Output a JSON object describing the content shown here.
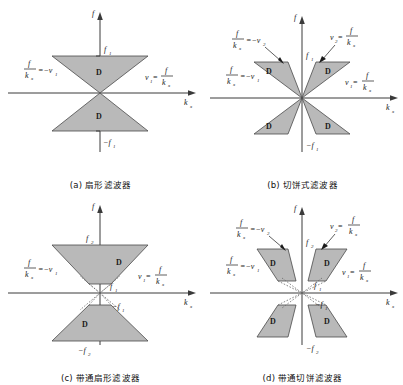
{
  "figure": {
    "title": "",
    "axis_labels": {
      "vertical": "f",
      "horizontal": "k",
      "horizontal_sub": "x"
    },
    "region_label": "D",
    "numerator": "f",
    "denominator": "k",
    "denominator_sub": "x"
  },
  "panels": [
    {
      "id": "a",
      "caption": "(a) 扇形滤波器",
      "type": "fan-filter",
      "cut_labels": {
        "top": "f",
        "top_sub": "1",
        "bottom": "−f",
        "bottom_sub": "1"
      },
      "slope_left": {
        "text": "=−v",
        "sub": "1",
        "side": "left"
      },
      "slope_right": {
        "text": "v",
        "sub": "1",
        "eq": "=",
        "side": "right"
      },
      "regions": [
        "D",
        "D"
      ]
    },
    {
      "id": "b",
      "caption": "(b) 切饼式滤波器",
      "type": "pie-slice-filter",
      "cut_labels": {
        "top": "f",
        "top_sub": "1",
        "bottom": "−f",
        "bottom_sub": "1"
      },
      "slope_outer_left": {
        "text": "=−v",
        "sub": "2"
      },
      "slope_outer_right": {
        "text": "v",
        "sub": "2",
        "eq": "="
      },
      "slope_inner_left": {
        "text": "=−v",
        "sub": "1"
      },
      "slope_inner_right": {
        "text": "v",
        "sub": "1",
        "eq": "="
      },
      "regions": [
        "D",
        "D",
        "D",
        "D"
      ]
    },
    {
      "id": "c",
      "caption": "(c) 带通扇形滤波器",
      "type": "bandpass-fan-filter",
      "cut_labels": {
        "outer_top": "f",
        "outer_top_sub": "2",
        "outer_bottom": "−f",
        "outer_bottom_sub": "2",
        "inner_top": "f",
        "inner_top_sub": "1",
        "inner_bottom": "−f",
        "inner_bottom_sub": "1"
      },
      "slope_left": {
        "text": "=−v",
        "sub": "1"
      },
      "slope_right": {
        "text": "v",
        "sub": "1",
        "eq": "="
      },
      "regions": [
        "D",
        "D"
      ]
    },
    {
      "id": "d",
      "caption": "(d) 带通切饼滤波器",
      "type": "bandpass-pie-slice-filter",
      "cut_labels": {
        "outer_top": "f",
        "outer_top_sub": "2",
        "outer_bottom": "−f",
        "outer_bottom_sub": "2",
        "inner_top": "f",
        "inner_top_sub": "1",
        "inner_bottom": "−f",
        "inner_bottom_sub": "1"
      },
      "slope_outer_left": {
        "text": "=−v",
        "sub": "2"
      },
      "slope_outer_right": {
        "text": "v",
        "sub": "2",
        "eq": "="
      },
      "slope_inner_left": {
        "text": "=−v",
        "sub": "1"
      },
      "slope_inner_right": {
        "text": "v",
        "sub": "1",
        "eq": "="
      },
      "regions": [
        "D",
        "D",
        "D",
        "D"
      ]
    }
  ],
  "colors": {
    "region_fill": "#b9b9b9",
    "region_stroke": "#4a4a4a",
    "axis": "#3a3a3a",
    "text": "#1a1a1a",
    "background": "#ffffff"
  }
}
